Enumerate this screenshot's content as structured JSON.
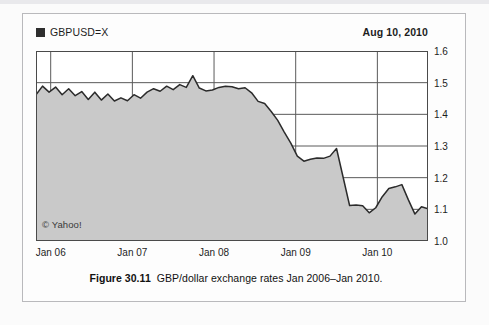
{
  "legend": {
    "series_label": "GBPUSD=X",
    "swatch_color": "#2e2e2e"
  },
  "as_of_date": "Aug 10, 2010",
  "watermark": "© Yahoo!",
  "caption": {
    "number": "Figure 30.11",
    "text": "GBP/dollar exchange rates Jan 2006–Jan 2010."
  },
  "colors": {
    "area_fill": "#c9c9c9",
    "line": "#2b2b2b",
    "grid": "#5a5a5a",
    "plot_background": "#ffffff",
    "frame": "#b9b9bc"
  },
  "chart_data": {
    "type": "area",
    "title": "GBP/dollar exchange rates Jan 2006–Jan 2010.",
    "series_name": "GBPUSD=X",
    "xlabel": "",
    "ylabel": "",
    "ylim": [
      1.0,
      1.6
    ],
    "ytick_labels": [
      "1.6",
      "1.5",
      "1.4",
      "1.3",
      "1.2",
      "1.1",
      "1.0"
    ],
    "ytick_values": [
      1.6,
      1.5,
      1.4,
      1.3,
      1.2,
      1.1,
      1.0
    ],
    "xtick_labels": [
      "Jan 06",
      "Jan 07",
      "Jan 08",
      "Jan 09",
      "Jan 10"
    ],
    "xtick_values": [
      2006.0,
      2007.0,
      2008.0,
      2009.0,
      2010.0
    ],
    "xlim": [
      2005.82,
      2010.62
    ],
    "minor_ticks_per_year": 4,
    "grid": "both",
    "legend_position": "top-left",
    "x": [
      2005.82,
      2005.9,
      2005.98,
      2006.06,
      2006.14,
      2006.22,
      2006.3,
      2006.38,
      2006.46,
      2006.54,
      2006.62,
      2006.7,
      2006.78,
      2006.86,
      2006.94,
      2007.02,
      2007.1,
      2007.18,
      2007.26,
      2007.34,
      2007.42,
      2007.5,
      2007.58,
      2007.66,
      2007.74,
      2007.82,
      2007.9,
      2007.98,
      2008.06,
      2008.14,
      2008.22,
      2008.3,
      2008.38,
      2008.46,
      2008.54,
      2008.62,
      2008.7,
      2008.78,
      2008.86,
      2008.94,
      2009.02,
      2009.1,
      2009.18,
      2009.26,
      2009.34,
      2009.42,
      2009.5,
      2009.58,
      2009.66,
      2009.74,
      2009.82,
      2009.9,
      2009.98,
      2010.06,
      2010.14,
      2010.22,
      2010.3,
      2010.38,
      2010.46,
      2010.54,
      2010.62
    ],
    "values": [
      1.462,
      1.489,
      1.47,
      1.486,
      1.462,
      1.481,
      1.459,
      1.472,
      1.447,
      1.47,
      1.445,
      1.464,
      1.442,
      1.452,
      1.443,
      1.462,
      1.451,
      1.47,
      1.481,
      1.473,
      1.489,
      1.478,
      1.494,
      1.485,
      1.522,
      1.483,
      1.474,
      1.477,
      1.485,
      1.489,
      1.487,
      1.481,
      1.484,
      1.468,
      1.441,
      1.434,
      1.409,
      1.381,
      1.344,
      1.309,
      1.268,
      1.252,
      1.258,
      1.262,
      1.261,
      1.268,
      1.292,
      1.202,
      1.112,
      1.114,
      1.111,
      1.089,
      1.105,
      1.14,
      1.166,
      1.171,
      1.178,
      1.13,
      1.085,
      1.108,
      1.102
    ],
    "values_tail": [
      1.112,
      1.141,
      1.118,
      1.107,
      1.122,
      1.148,
      1.176,
      1.206,
      1.222,
      1.196,
      1.212,
      1.203
    ],
    "notes": [
      "Area chart filled from the line down to the 1.0 baseline.",
      "2006 oscillates roughly between 1.44 and 1.49.",
      "Peak near Jan 2007 reaches about 1.52.",
      "Sharp decline through 2008 from about 1.48 to about 1.25.",
      "Brief rebound to about 1.29 in late 2008 then crash to about 1.11.",
      "2009–2010 range roughly 1.08 to 1.22, ending about 1.20."
    ]
  }
}
